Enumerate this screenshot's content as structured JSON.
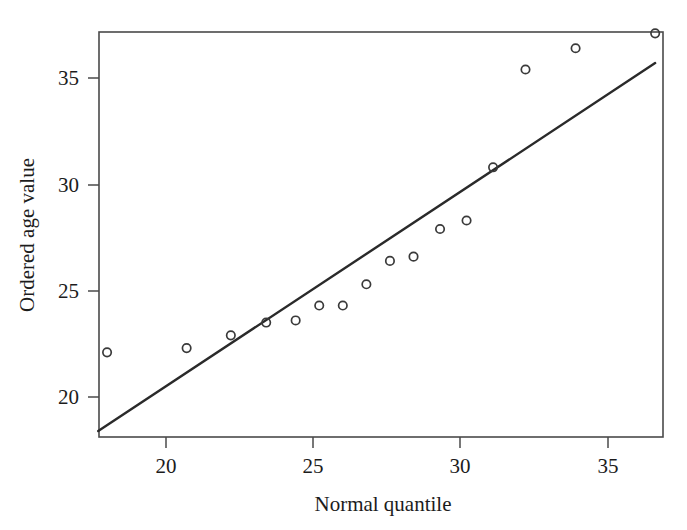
{
  "chart_data": {
    "type": "scatter",
    "title": "",
    "subtitle": "",
    "xlabel": "Normal quantile",
    "ylabel": "Ordered age value",
    "xlim": [
      17.4,
      37.0
    ],
    "ylim": [
      18.3,
      37.6
    ],
    "grid": false,
    "legend": null,
    "xticks": [
      20,
      25,
      30,
      35
    ],
    "xtick_labels": [
      "20",
      "25",
      "30",
      "35"
    ],
    "yticks": [
      20,
      25,
      30,
      35
    ],
    "ytick_labels": [
      "20",
      "25",
      "30",
      "35"
    ],
    "points": [
      {
        "x": 18.0,
        "y": 22.1
      },
      {
        "x": 20.7,
        "y": 22.3
      },
      {
        "x": 22.2,
        "y": 22.9
      },
      {
        "x": 23.4,
        "y": 23.5
      },
      {
        "x": 24.4,
        "y": 23.6
      },
      {
        "x": 25.2,
        "y": 24.3
      },
      {
        "x": 26.0,
        "y": 24.3
      },
      {
        "x": 26.8,
        "y": 25.3
      },
      {
        "x": 27.6,
        "y": 26.4
      },
      {
        "x": 28.4,
        "y": 26.6
      },
      {
        "x": 29.3,
        "y": 27.9
      },
      {
        "x": 30.2,
        "y": 28.3
      },
      {
        "x": 31.1,
        "y": 30.8
      },
      {
        "x": 32.2,
        "y": 35.4
      },
      {
        "x": 33.9,
        "y": 36.4
      },
      {
        "x": 36.6,
        "y": 37.1
      }
    ],
    "reference_line": {
      "style": "solid",
      "x_start": 17.7,
      "y_start": 18.4,
      "x_end": 36.6,
      "y_end": 35.7
    },
    "marker": "open-circle",
    "annotations": []
  },
  "figure": {
    "background_color": "#ffffff",
    "frame_color": "#4a4a4a",
    "line_color": "#2a2a2a",
    "marker_color": "#3a3a3a",
    "text_color": "#1c1c1c"
  }
}
